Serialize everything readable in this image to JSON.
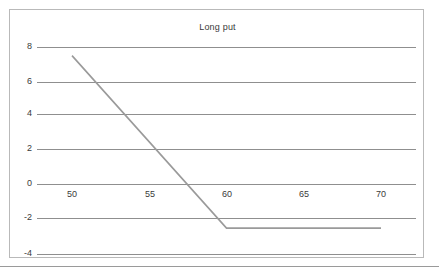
{
  "chart_data": {
    "type": "line",
    "title": "Long put",
    "xlabel": "",
    "ylabel": "",
    "xlim": [
      48.0,
      72.0
    ],
    "ylim": [
      -4.6,
      8.6
    ],
    "xticks": [
      50,
      55,
      60,
      65,
      70
    ],
    "yticks": [
      8,
      6,
      4,
      2,
      0,
      -2,
      -4
    ],
    "grid": "horizontal",
    "legend": "none",
    "series": [
      {
        "name": "Long put payoff",
        "color": "#9a9a9a",
        "x": [
          50,
          60,
          70
        ],
        "values": [
          7.5,
          -2.5,
          -2.5
        ]
      }
    ],
    "annotations": {
      "strike": 60,
      "premium": 2.5,
      "breakeven": 57.5
    }
  },
  "figure": {
    "title": "Long put",
    "y_tick_labels": [
      "8",
      "6",
      "4",
      "2",
      "0",
      "-2",
      "-4"
    ],
    "x_tick_labels": [
      "50",
      "55",
      "60",
      "65",
      "70"
    ]
  }
}
